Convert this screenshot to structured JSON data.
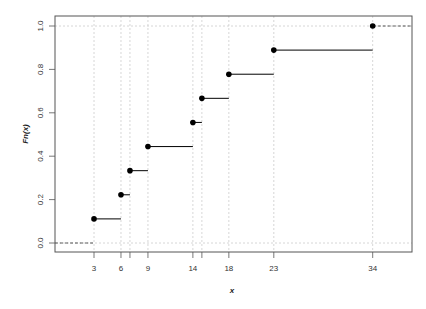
{
  "chart_data": {
    "type": "line",
    "subtype": "empirical-cdf-step",
    "title": "",
    "xlabel": "x",
    "ylabel": "Fn(x)",
    "x_ticks": [
      3,
      6,
      7,
      9,
      14,
      15,
      18,
      23,
      34
    ],
    "x_tick_labels": [
      "3",
      "6",
      "",
      "9",
      "14",
      "",
      "18",
      "23",
      "34"
    ],
    "y_ticks": [
      0.0,
      0.2,
      0.4,
      0.6,
      0.8,
      1.0
    ],
    "y_tick_labels": [
      "0.0",
      "0.2",
      "0.4",
      "0.6",
      "0.8",
      "1.0"
    ],
    "xlim": [
      -1.3,
      39.7
    ],
    "ylim": [
      -0.04,
      1.04
    ],
    "grid": {
      "vertical_at_points": true,
      "horizontal_at": [
        0,
        1
      ],
      "style": "dotted",
      "color": "#cccccc"
    },
    "x": [
      3,
      6,
      7,
      9,
      14,
      15,
      18,
      23,
      34
    ],
    "y": [
      0.1111,
      0.2222,
      0.3333,
      0.4444,
      0.5556,
      0.6667,
      0.7778,
      0.8889,
      1.0
    ],
    "series": [
      {
        "name": "Fn(x)",
        "x": [
          3,
          6,
          7,
          9,
          14,
          15,
          18,
          23,
          34
        ],
        "values": [
          0.1111,
          0.2222,
          0.3333,
          0.4444,
          0.5556,
          0.6667,
          0.7778,
          0.8889,
          1.0
        ]
      }
    ],
    "colors": {
      "points": "#000000",
      "steps": "#000000",
      "grid": "#cccccc",
      "axis": "#444444"
    }
  }
}
